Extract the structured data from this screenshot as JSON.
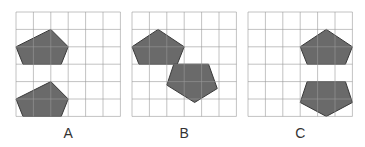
{
  "figure": {
    "grid": {
      "cols": 6,
      "rows": 6,
      "cell_px": 17.4,
      "line_color": "#9a9a9a",
      "bg": "#ffffff"
    },
    "shape_fill": "#6a6a6a",
    "shape_stroke": "#3a3a3a",
    "panels": [
      {
        "label": "A",
        "origin": [
          16,
          12
        ],
        "shapes": [
          {
            "type": "pentagon",
            "points": [
              [
                2,
                1
              ],
              [
                3,
                2
              ],
              [
                2.6,
                3
              ],
              [
                0.4,
                3
              ],
              [
                0,
                2
              ]
            ]
          },
          {
            "type": "pentagon",
            "points": [
              [
                2,
                4
              ],
              [
                3,
                5
              ],
              [
                2.6,
                6
              ],
              [
                0.4,
                6
              ],
              [
                0,
                5
              ]
            ]
          }
        ]
      },
      {
        "label": "B",
        "origin": [
          132,
          12
        ],
        "shapes": [
          {
            "type": "pentagon",
            "points": [
              [
                1.5,
                1
              ],
              [
                3,
                2
              ],
              [
                2.6,
                3
              ],
              [
                0.4,
                3
              ],
              [
                0,
                2
              ]
            ]
          },
          {
            "type": "pentagon",
            "points": [
              [
                2.4,
                3
              ],
              [
                4.4,
                3
              ],
              [
                4.9,
                4.4
              ],
              [
                3.6,
                5.2
              ],
              [
                2,
                4.2
              ]
            ]
          }
        ]
      },
      {
        "label": "C",
        "origin": [
          248,
          12
        ],
        "shapes": [
          {
            "type": "pentagon",
            "points": [
              [
                4.5,
                1
              ],
              [
                6,
                2
              ],
              [
                5.6,
                3
              ],
              [
                3.4,
                3
              ],
              [
                3,
                2
              ]
            ]
          },
          {
            "type": "pentagon",
            "points": [
              [
                3.4,
                4
              ],
              [
                5.6,
                4
              ],
              [
                6,
                5.2
              ],
              [
                4.5,
                6
              ],
              [
                3,
                5.2
              ]
            ]
          }
        ]
      }
    ]
  }
}
